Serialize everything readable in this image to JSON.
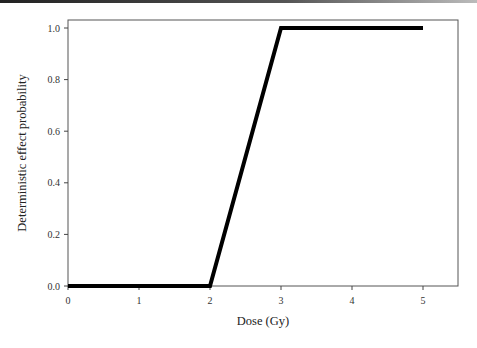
{
  "chart_data": {
    "type": "line",
    "title": "",
    "xlabel": "Dose (Gy)",
    "ylabel": "Deterministic effect probability",
    "xlim": [
      0,
      5.5
    ],
    "ylim": [
      0,
      1.05
    ],
    "x_ticks": [
      "0",
      "1",
      "2",
      "3",
      "4",
      "5"
    ],
    "y_ticks": [
      "0.0",
      "0.2",
      "0.4",
      "0.6",
      "0.8",
      "1.0"
    ],
    "grid": false,
    "legend": null,
    "series": [
      {
        "name": "Deterministic effect",
        "color": "#000000",
        "x": [
          0,
          2,
          3,
          5
        ],
        "y": [
          0.0,
          0.0,
          1.0,
          1.0
        ]
      }
    ]
  }
}
